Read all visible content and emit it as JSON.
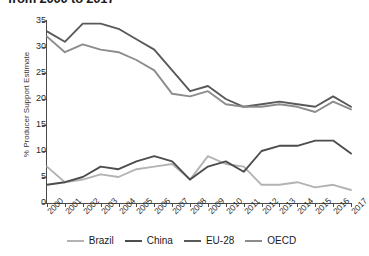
{
  "chart_data": {
    "type": "line",
    "title": "from 2000 to 2017",
    "xlabel": "",
    "ylabel": "% Producer Support Estimate",
    "categories": [
      "2000",
      "2001",
      "2002",
      "2003",
      "2004",
      "2005",
      "2006",
      "2007",
      "2008",
      "2009",
      "2010",
      "2011",
      "2012",
      "2013",
      "2014",
      "2015",
      "2016",
      "2017"
    ],
    "ylim": [
      0,
      35
    ],
    "yticks": [
      "0",
      "5",
      "10",
      "15",
      "20",
      "25",
      "30",
      "35"
    ],
    "grid": false,
    "legend_position": "bottom",
    "series": [
      {
        "name": "Brazil",
        "color": "#b3b3b3",
        "values": [
          7,
          4,
          4.5,
          5.5,
          5,
          6.5,
          7,
          7.5,
          4.5,
          9,
          7.5,
          7,
          3.5,
          3.5,
          4,
          3,
          3.5,
          2.5
        ]
      },
      {
        "name": "China",
        "color": "#4d4d4d",
        "values": [
          3.5,
          4,
          5,
          7,
          6.5,
          8,
          9,
          8,
          4.5,
          7,
          8,
          6,
          10,
          11,
          11,
          12,
          12,
          9.5
        ]
      },
      {
        "name": "EU-28",
        "color": "#595959",
        "values": [
          33,
          31,
          34.5,
          34.5,
          33.5,
          31.5,
          29.5,
          25.5,
          21.5,
          22.5,
          20,
          18.5,
          19,
          19.5,
          19,
          18.5,
          20.5,
          18.5
        ]
      },
      {
        "name": "OECD",
        "color": "#8c8c8c",
        "values": [
          32,
          29,
          30.5,
          29.5,
          29,
          27.5,
          25.5,
          21,
          20.5,
          21.5,
          19,
          18.5,
          18.5,
          19,
          18.5,
          17.5,
          19.5,
          18
        ]
      }
    ]
  }
}
